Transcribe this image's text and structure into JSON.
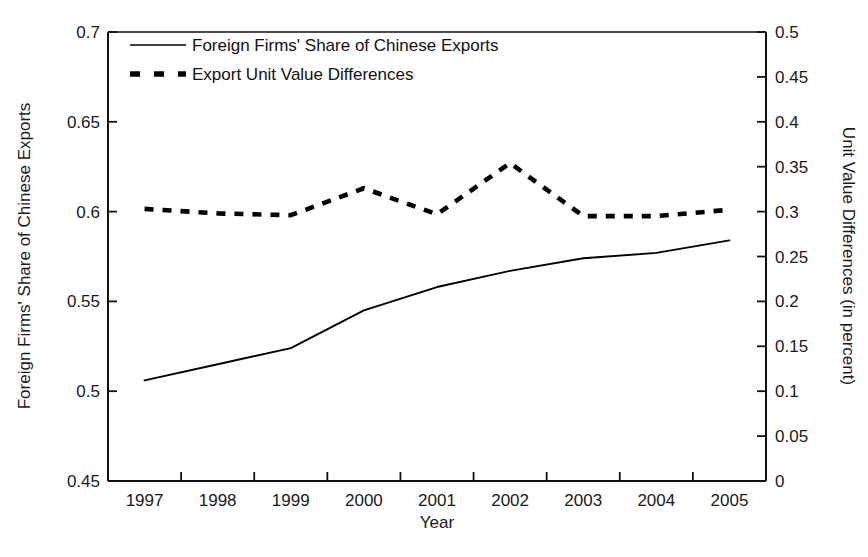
{
  "chart_data": {
    "type": "line",
    "title": "",
    "xlabel": "Year",
    "ylabel": "Foreign Firms' Share of Chinese Exports",
    "y2label": "Unit Value Differences (in percent)",
    "categories": [
      "1997",
      "1998",
      "1999",
      "2000",
      "2001",
      "2002",
      "2003",
      "2004",
      "2005"
    ],
    "x": [
      1997,
      1998,
      1999,
      2000,
      2001,
      2002,
      2003,
      2004,
      2005
    ],
    "xlim": [
      1996.5,
      2005.5
    ],
    "ylim": [
      0.45,
      0.7
    ],
    "y2lim": [
      0,
      0.5
    ],
    "yticks": [
      "0.7",
      "0.65",
      "0.6",
      "0.55",
      "0.5",
      "0.45"
    ],
    "ytick_values": [
      0.7,
      0.65,
      0.6,
      0.55,
      0.5,
      0.45
    ],
    "y2ticks": [
      "0.5",
      "0.45",
      "0.4",
      "0.35",
      "0.3",
      "0.25",
      "0.2",
      "0.15",
      "0.1",
      "0.05",
      "0"
    ],
    "y2tick_values": [
      0.5,
      0.45,
      0.4,
      0.35,
      0.3,
      0.25,
      0.2,
      0.15,
      0.1,
      0.05,
      0
    ],
    "grid": false,
    "legend_position": "top-left",
    "series": [
      {
        "name": "Foreign Firms' Share of Chinese Exports",
        "axis": "left",
        "style": "solid",
        "color": "#000000",
        "values": [
          0.506,
          0.515,
          0.524,
          0.545,
          0.558,
          0.567,
          0.574,
          0.577,
          0.584
        ]
      },
      {
        "name": "Export Unit Value Differences",
        "axis": "right",
        "style": "dashed",
        "color": "#000000",
        "values": [
          0.303,
          0.298,
          0.296,
          0.326,
          0.297,
          0.354,
          0.295,
          0.295,
          0.302
        ]
      }
    ]
  },
  "legend": {
    "items": [
      {
        "label": "Foreign Firms' Share of Chinese Exports",
        "style": "solid"
      },
      {
        "label": "Export Unit Value Differences",
        "style": "dashed"
      }
    ]
  },
  "axes": {
    "x_title": "Year",
    "y_left_title": "Foreign Firms' Share of Chinese Exports",
    "y_right_title": "Unit Value Differences (in percent)"
  }
}
